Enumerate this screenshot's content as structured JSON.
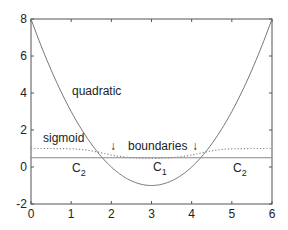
{
  "chart_data": {
    "type": "line",
    "title": "",
    "xlabel": "",
    "ylabel": "",
    "xlim": [
      0,
      6
    ],
    "ylim": [
      -2,
      8
    ],
    "grid": false,
    "x_ticks": [
      "0",
      "1",
      "2",
      "3",
      "4",
      "5",
      "6"
    ],
    "y_ticks": [
      "-2",
      "0",
      "2",
      "4",
      "6",
      "8"
    ],
    "series": [
      {
        "name": "quadratic",
        "style": "solid",
        "formula": "(x-3)^2 - 1",
        "x": [
          0,
          1,
          2,
          3,
          4,
          5,
          6
        ],
        "values": [
          8,
          3,
          0,
          -1,
          0,
          3,
          8
        ]
      },
      {
        "name": "sigmoid",
        "style": "dotted",
        "x": [
          0,
          1,
          2,
          3,
          4,
          5,
          6
        ],
        "values": [
          1.0,
          0.95,
          0.6,
          0.35,
          0.6,
          0.95,
          1.0
        ]
      },
      {
        "name": "threshold",
        "style": "solid",
        "x": [
          0,
          6
        ],
        "values": [
          0.5,
          0.5
        ]
      }
    ],
    "annotations": [
      {
        "text": "quadratic",
        "x": 1.6,
        "y": 3.8
      },
      {
        "text": "sigmoid",
        "x": 0.7,
        "y": 1.4
      },
      {
        "text": "boundaries",
        "x": 3.1,
        "y": 0.9
      },
      {
        "text": "↓",
        "x": 2.1,
        "y": 0.9
      },
      {
        "text": "↓",
        "x": 4.15,
        "y": 0.9
      },
      {
        "text": "C2",
        "x": 1.05,
        "y": 0.0
      },
      {
        "text": "C1",
        "x": 3.05,
        "y": 0.0
      },
      {
        "text": "C2",
        "x": 5.2,
        "y": 0.0
      }
    ]
  },
  "labels": {
    "quadratic": "quadratic",
    "sigmoid": "sigmoid",
    "boundaries": "boundaries",
    "arrow": "↓",
    "class_letter": "C",
    "c1_sub": "1",
    "c2_sub": "2"
  }
}
